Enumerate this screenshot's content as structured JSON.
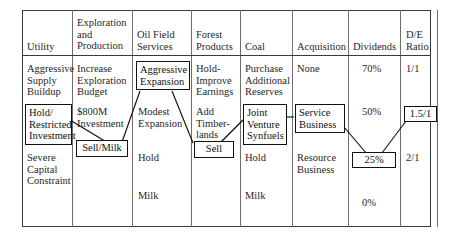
{
  "figure": {
    "type": "strategy-options-matrix",
    "columns": [
      {
        "id": "utility",
        "header": "Utility"
      },
      {
        "id": "exploration",
        "header": "Exploration\nand\nProduction"
      },
      {
        "id": "oilfield",
        "header": "Oil Field\nServices"
      },
      {
        "id": "forest",
        "header": "Forest\nProducts"
      },
      {
        "id": "coal",
        "header": "Coal"
      },
      {
        "id": "acquisition",
        "header": "Acquisition"
      },
      {
        "id": "dividends",
        "header": "Dividends"
      },
      {
        "id": "de_ratio",
        "header": "D/E\nRatio"
      }
    ],
    "options": {
      "utility": [
        {
          "text": "Aggressive\nSupply\nBuildup",
          "selected": false
        },
        {
          "text": "Hold/\nRestricted\nInvestment",
          "selected": true
        },
        {
          "text": "Severe\nCapital\nConstraint",
          "selected": false
        }
      ],
      "exploration": [
        {
          "text": "Increase\nExploration\nBudget",
          "selected": false
        },
        {
          "text": "$800M\nInvestment",
          "selected": false
        },
        {
          "text": "Sell/Milk",
          "selected": true
        }
      ],
      "oilfield": [
        {
          "text": "Aggressive\nExpansion",
          "selected": true
        },
        {
          "text": "Modest\nExpansion",
          "selected": false
        },
        {
          "text": "Hold",
          "selected": false
        },
        {
          "text": "Milk",
          "selected": false
        }
      ],
      "forest": [
        {
          "text": "Hold-\nImprove\nEarnings",
          "selected": false
        },
        {
          "text": "Add\nTimber-\nlands",
          "selected": false
        },
        {
          "text": "Sell",
          "selected": true
        }
      ],
      "coal": [
        {
          "text": "Purchase\nAdditional\nReserves",
          "selected": false
        },
        {
          "text": "Joint\nVenture\nSynfuels",
          "selected": true
        },
        {
          "text": "Hold",
          "selected": false
        },
        {
          "text": "Milk",
          "selected": false
        }
      ],
      "acquisition": [
        {
          "text": "None",
          "selected": false
        },
        {
          "text": "Service\nBusiness",
          "selected": true
        },
        {
          "text": "Resource\nBusiness",
          "selected": false
        }
      ],
      "dividends": [
        {
          "text": "70%",
          "selected": false
        },
        {
          "text": "50%",
          "selected": false
        },
        {
          "text": "25%",
          "selected": true
        },
        {
          "text": "0%",
          "selected": false
        }
      ],
      "de_ratio": [
        {
          "text": "1/1",
          "selected": false
        },
        {
          "text": "1.5/1",
          "selected": true
        },
        {
          "text": "2/1",
          "selected": false
        }
      ]
    },
    "connections": [
      {
        "from": "hold-restricted-investment",
        "to": "sell-milk"
      },
      {
        "from": "aggressive-expansion",
        "to": "sell-milk"
      },
      {
        "from": "aggressive-expansion",
        "to": "sell"
      },
      {
        "from": "sell",
        "to": "joint-venture-synfuels"
      },
      {
        "from": "joint-venture-synfuels",
        "to": "service-business"
      },
      {
        "from": "service-business",
        "to": "dividends-25"
      },
      {
        "from": "dividends-25",
        "to": "de-ratio-1-5-1"
      }
    ],
    "colors": {
      "frame": "#3a3a3a",
      "divider": "#6e6e6e",
      "box_border": "#111111",
      "text": "#1f1f1f",
      "connector": "#111111",
      "background": "#ffffff"
    }
  }
}
